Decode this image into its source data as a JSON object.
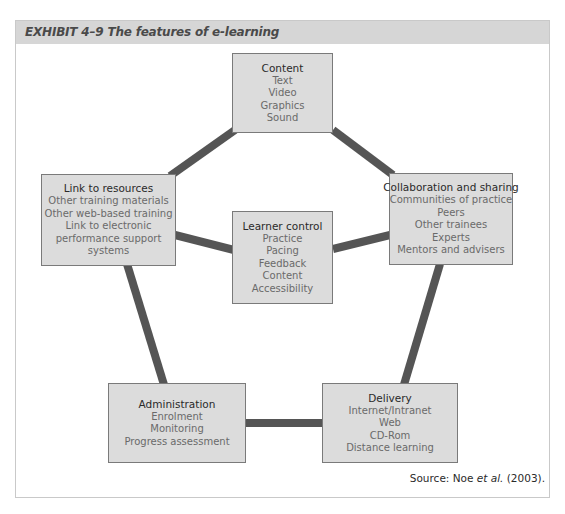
{
  "exhibit": {
    "title": "EXHIBIT 4–9  The features of e-learning"
  },
  "colors": {
    "header_band": "#d6d6d6",
    "node_fill": "#dcdcdc",
    "node_border": "#7a7a7a",
    "connector": "#555555"
  },
  "nodes": {
    "content": {
      "title": "Content",
      "items": [
        "Text",
        "Video",
        "Graphics",
        "Sound"
      ]
    },
    "link_to_resources": {
      "title": "Link to resources",
      "items": [
        "Other training materials",
        "Other web-based training",
        "Link to electronic",
        "performance support",
        "systems"
      ]
    },
    "collaboration": {
      "title": "Collaboration and sharing",
      "items": [
        "Communities of practice",
        "Peers",
        "Other trainees",
        "Experts",
        "Mentors and advisers"
      ]
    },
    "learner_control": {
      "title": "Learner control",
      "items": [
        "Practice",
        "Pacing",
        "Feedback",
        "Content",
        "Accessibility"
      ]
    },
    "administration": {
      "title": "Administration",
      "items": [
        "Enrolment",
        "Monitoring",
        "Progress assessment"
      ]
    },
    "delivery": {
      "title": "Delivery",
      "items": [
        "Internet/Intranet",
        "Web",
        "CD-Rom",
        "Distance learning"
      ]
    }
  },
  "connections": [
    [
      "content",
      "link_to_resources"
    ],
    [
      "content",
      "collaboration"
    ],
    [
      "link_to_resources",
      "administration"
    ],
    [
      "collaboration",
      "delivery"
    ],
    [
      "administration",
      "delivery"
    ],
    [
      "link_to_resources",
      "learner_control"
    ],
    [
      "collaboration",
      "learner_control"
    ]
  ],
  "source": {
    "prefix": "Source: Noe ",
    "italic": "et al.",
    "suffix": " (2003)."
  }
}
